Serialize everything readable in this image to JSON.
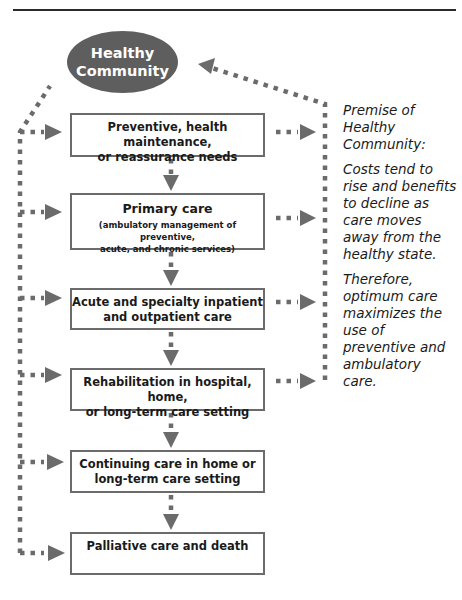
{
  "diagram": {
    "top_node": {
      "line1": "Healthy",
      "line2": "Community"
    },
    "boxes": [
      {
        "title": "Preventive, health maintenance,",
        "title2": "or reassurance needs"
      },
      {
        "title": "Primary  care",
        "sub1": "(ambulatory management of preventive,",
        "sub2": "acute, and chronic services)"
      },
      {
        "title": "Acute and specialty inpatient",
        "title2": "and outpatient care"
      },
      {
        "title": "Rehabilitation in hospital, home,",
        "title2": "or long-term care setting"
      },
      {
        "title": "Continuing care in home or",
        "title2": "long-term care setting"
      },
      {
        "title": "Palliative care and death"
      }
    ],
    "premise": {
      "heading": "Premise of Healthy Community:",
      "paragraph1": "Costs tend to rise and benefits to decline as care moves away from the healthy state.",
      "paragraph2": "Therefore, optimum care maximizes the use of preventive and ambulatory care."
    },
    "colors": {
      "node_fill": "#5e5e5e",
      "box_border": "#6b6b6b",
      "arrow": "#6b6b6b",
      "rule": "#2a2a2a"
    }
  }
}
